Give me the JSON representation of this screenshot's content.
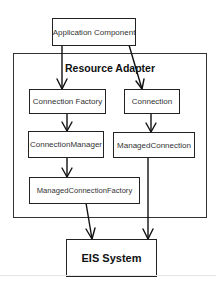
{
  "diagram": {
    "container": {
      "title": "Resource Adapter"
    },
    "nodes": {
      "application_component": "Application Component",
      "connection_factory": "Connection Factory",
      "connection": "Connection",
      "connection_manager": "ConnectionManager",
      "managed_connection": "ManagedConnection",
      "managed_connection_factory": "ManagedConnectionFactory",
      "eis_system": "EIS System"
    },
    "edges": [
      {
        "from": "Application Component",
        "to": "Connection Factory"
      },
      {
        "from": "Application Component",
        "to": "Connection"
      },
      {
        "from": "Connection Factory",
        "to": "ConnectionManager"
      },
      {
        "from": "ConnectionManager",
        "to": "ManagedConnectionFactory"
      },
      {
        "from": "Connection",
        "to": "ManagedConnection"
      },
      {
        "from": "ManagedConnectionFactory",
        "to": "EIS System"
      },
      {
        "from": "ManagedConnection",
        "to": "EIS System"
      }
    ]
  }
}
